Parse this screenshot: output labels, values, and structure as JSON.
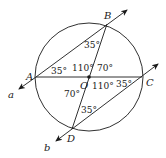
{
  "diagram": {
    "type": "geometry",
    "stroke_color": "#1a1a1a",
    "background": "#ffffff",
    "circle": {
      "center": "O",
      "cx": 89,
      "cy": 77,
      "r": 54
    },
    "points": {
      "A": {
        "label": "A",
        "x": 36,
        "y": 77
      },
      "B": {
        "label": "B",
        "x": 107,
        "y": 24
      },
      "C": {
        "label": "C",
        "x": 142,
        "y": 77
      },
      "D": {
        "label": "D",
        "x": 72,
        "y": 129
      },
      "O": {
        "label": "O",
        "x": 89,
        "y": 77
      }
    },
    "lines": {
      "a": {
        "label": "a",
        "through": [
          "A",
          "B"
        ]
      },
      "b": {
        "label": "b",
        "through": [
          "D",
          "C"
        ]
      }
    },
    "segments": [
      "AC",
      "BD"
    ],
    "angles": {
      "ABO": "35°",
      "BAO": "35°",
      "AOB": "110°",
      "BOC": "70°",
      "AOD": "70°",
      "COD": "110°",
      "OCD": "35°",
      "ODC": "35°"
    }
  }
}
